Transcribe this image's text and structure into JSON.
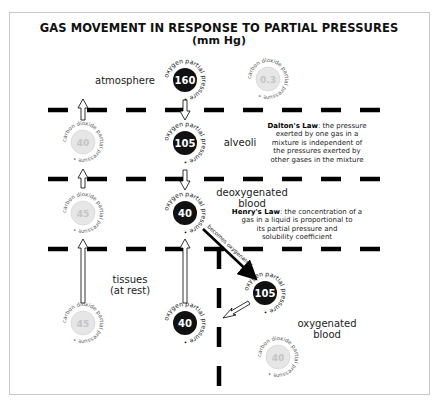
{
  "title": "GAS MOVEMENT IN RESPONSE TO PARTIAL PRESSURES",
  "subtitle": "(mm Hg)",
  "regions": {
    "atmosphere": "atmosphere",
    "alveoli": "alveoli",
    "deoxygenated_blood_line1": "deoxygenated",
    "deoxygenated_blood_line2": "blood",
    "tissues_line1": "tissues",
    "tissues_line2": "(at rest)",
    "oxygenated_blood_line1": "oxygenated",
    "oxygenated_blood_line2": "blood"
  },
  "laws": {
    "dalton": {
      "name": "Dalton's Law",
      "text_lines": [
        ": the pressure",
        "exerted by one gas in a",
        "mixture is independent of",
        "the pressures exerted by",
        "other gases in the mixture"
      ]
    },
    "henry": {
      "name": "Henry's Law",
      "text_lines": [
        ": the concentration of a",
        "gas in a liquid is proportional to",
        "its partial pressure and",
        "solubility coefficient"
      ]
    }
  },
  "arrow_label": "becomes oxygenated",
  "ring_labels": {
    "oxygen": "oxygen partial pressure •",
    "carbon_dioxide": "carbon dioxide partial pressure •"
  },
  "pressures": {
    "atmosphere": {
      "oxygen": "160",
      "carbon_dioxide": "0.3"
    },
    "alveoli": {
      "oxygen": "105",
      "carbon_dioxide": "40"
    },
    "deoxygenated_blood": {
      "oxygen": "40",
      "carbon_dioxide": "45"
    },
    "tissues": {
      "oxygen": "40",
      "carbon_dioxide": "45"
    },
    "oxygenated_blood": {
      "oxygen": "105",
      "carbon_dioxide": "40"
    }
  },
  "colors": {
    "oxygen_fill": "#111111",
    "oxygen_text": "#ffffff",
    "co2_fill": "#e6e6e6",
    "co2_text": "#c4c4c4",
    "line": "#000000",
    "frame": "#c8c8c8"
  }
}
